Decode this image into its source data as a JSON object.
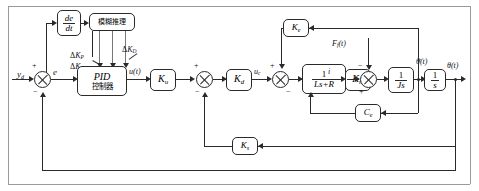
{
  "diagram": {
    "type": "control-block-diagram",
    "colors": {
      "line": "#2a2a2a",
      "text": "#111111",
      "background": "#ffffff"
    },
    "blocks": [
      {
        "id": "derivative",
        "label_num": "de",
        "label_den": "dt",
        "kind": "fraction"
      },
      {
        "id": "fuzzy",
        "label": "模糊推理",
        "kind": "text"
      },
      {
        "id": "pid",
        "label_top": "PID",
        "label_bottom": "控制器",
        "kind": "two-line"
      },
      {
        "id": "ku",
        "label_main": "K",
        "label_sub": "u",
        "kind": "gain"
      },
      {
        "id": "kd",
        "label_main": "K",
        "label_sub": "d",
        "kind": "gain"
      },
      {
        "id": "electrical",
        "label_num": "1",
        "label_den": "Ls+R",
        "kind": "fraction"
      },
      {
        "id": "km",
        "label_main": "K",
        "label_sub": "m",
        "kind": "gain"
      },
      {
        "id": "inertia",
        "label_num": "1",
        "label_den": "Js",
        "kind": "fraction"
      },
      {
        "id": "integrator",
        "label_num": "1",
        "label_den": "s",
        "kind": "fraction"
      },
      {
        "id": "ke",
        "label_main": "K",
        "label_sub": "e",
        "kind": "gain"
      },
      {
        "id": "ce",
        "label_main": "C",
        "label_sub": "e",
        "kind": "gain"
      },
      {
        "id": "ks",
        "label_main": "K",
        "label_sub": "s",
        "kind": "gain"
      }
    ],
    "signals": {
      "reference": "y",
      "reference_sub": "d",
      "error": "e",
      "pid_output": "u(t)",
      "control_voltage": "u",
      "control_voltage_sub": "c",
      "current": "i",
      "disturbance": "F",
      "disturbance_sub": "f",
      "disturbance_arg": "(t)",
      "velocity": "θ(t)",
      "velocity_dot": "̇",
      "position": "θ(t)"
    },
    "tuning_labels": [
      {
        "id": "dkp",
        "delta": "Δ",
        "main": "K",
        "sub": "P"
      },
      {
        "id": "dki",
        "delta": "Δ",
        "main": "K",
        "sub": "I"
      },
      {
        "id": "dkd",
        "delta": "Δ",
        "main": "K",
        "sub": "D"
      }
    ],
    "summing_junctions": [
      {
        "id": "sum-error",
        "plus": "+",
        "minus": "−"
      },
      {
        "id": "sum-voltage",
        "plus": "+",
        "minus": "−"
      },
      {
        "id": "sum-emf",
        "plus": "+",
        "minus": "−"
      },
      {
        "id": "sum-torque",
        "plus": "+",
        "minus": "−"
      }
    ]
  }
}
